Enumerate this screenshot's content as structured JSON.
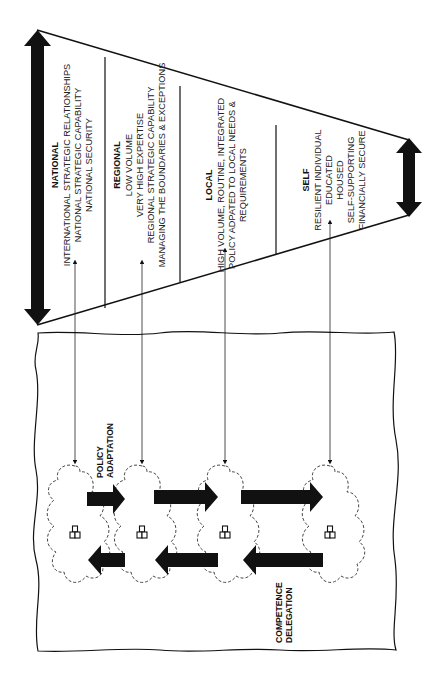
{
  "diagram": {
    "orientation": "rotated -90deg (text reads bottom-to-top)",
    "sections": [
      {
        "id": "national",
        "title": "NATIONAL",
        "lines": [
          "INTERNATIONAL STRATEGIC RELATIONSHIPS",
          "NATIONAL STRATEGIC CAPABILITY",
          "NATIONAL SECURITY"
        ]
      },
      {
        "id": "regional",
        "title": "REGIONAL",
        "lines": [
          "LOW VOLUME",
          "VERY HIGH EXPERTISE",
          "REGIONAL STRATEGIC CAPABILITY",
          "MANAGING THE BOUNDARIES & EXCEPTIONS"
        ]
      },
      {
        "id": "local",
        "title": "LOCAL",
        "lines": [
          "HIGH VOLUME, ROUTINE, INTEGRATED",
          "POLICY ADPATED TO LOCAL NEEDS &",
          "REQUIREMENTS"
        ]
      },
      {
        "id": "self",
        "title": "SELF",
        "lines": [
          "RESILIENT INDIVIDUAL",
          "EDUCATED",
          "HOUSED",
          "SELF-SUPPORTING",
          "FINANCIALLY SECURE"
        ]
      }
    ],
    "labels": {
      "policy_adaptation": [
        "POLICY",
        "ADAPTATION"
      ],
      "competence_delegation": [
        "COMPETENCE",
        "DELEGATION"
      ]
    },
    "nodes": [
      {
        "id": "national-node",
        "icon": "org-chart-icon"
      },
      {
        "id": "regional-node",
        "icon": "org-chart-icon"
      },
      {
        "id": "local-node",
        "icon": "org-chart-icon"
      },
      {
        "id": "self-node",
        "icon": "org-chart-icon"
      }
    ],
    "colors": {
      "ink": "#111111",
      "background": "#ffffff"
    }
  }
}
